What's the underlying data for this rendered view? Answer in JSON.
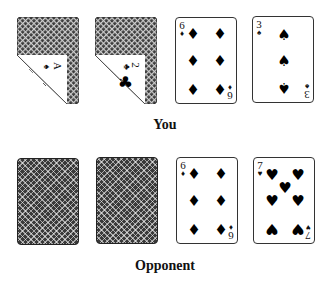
{
  "players": [
    {
      "label": "You",
      "cards": [
        {
          "state": "peeked",
          "rank": "A",
          "suit": "spades",
          "suit_glyph": "♠"
        },
        {
          "state": "peeked",
          "rank": "2",
          "suit": "clubs",
          "suit_glyph": "♣"
        },
        {
          "state": "face-up",
          "rank": "6",
          "suit": "diamonds",
          "suit_glyph": "♦"
        },
        {
          "state": "face-up",
          "rank": "3",
          "suit": "spades",
          "suit_glyph": "♠"
        }
      ]
    },
    {
      "label": "Opponent",
      "cards": [
        {
          "state": "face-down"
        },
        {
          "state": "face-down"
        },
        {
          "state": "face-up",
          "rank": "6",
          "suit": "diamonds",
          "suit_glyph": "♦"
        },
        {
          "state": "face-up",
          "rank": "7",
          "suit": "hearts",
          "suit_glyph": "♥"
        }
      ]
    }
  ]
}
